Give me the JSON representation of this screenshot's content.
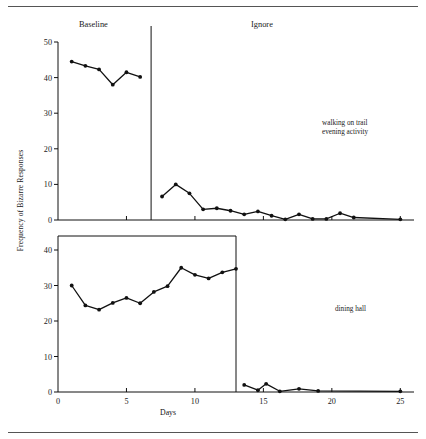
{
  "figure": {
    "ylabel": "Frequency of Bizarre Responses",
    "xlabel": "Days",
    "phase_headers": {
      "baseline": "Baseline",
      "ignore": "Ignore"
    },
    "annotations": {
      "top": "walking on trail\nevening activity",
      "bottom": "dining hall"
    }
  },
  "chart_data": {
    "type": "line",
    "title": "",
    "xlabel": "Days",
    "ylabel": "Frequency of Bizarre Responses",
    "xlim": [
      0,
      26
    ],
    "xticks": [
      0,
      5,
      10,
      15,
      20,
      25
    ],
    "xticklabels": [
      "0",
      "5",
      "10",
      "15",
      "20",
      "25"
    ],
    "grid": false,
    "legend": "none",
    "panels": [
      {
        "name": "walking on trail / evening activity",
        "annotation": "walking on trail\nevening activity",
        "ylim": [
          0,
          50
        ],
        "yticks": [
          0,
          10,
          20,
          30,
          40,
          50
        ],
        "yticklabels": [
          "0",
          "10",
          "20",
          "30",
          "40",
          "50"
        ],
        "phase_change_x": 6.8,
        "series": [
          {
            "name": "Baseline",
            "x": [
              1.0,
              2.0,
              3.0,
              4.0,
              5.0,
              6.0
            ],
            "y": [
              44.5,
              43.3,
              42.3,
              38.0,
              41.5,
              40.2
            ]
          },
          {
            "name": "Ignore",
            "x": [
              7.6,
              8.6,
              9.6,
              10.6,
              11.6,
              12.6,
              13.6,
              14.6,
              15.6,
              16.6,
              17.6,
              18.6,
              19.6,
              20.6,
              21.6,
              25.0
            ],
            "y": [
              6.6,
              10.0,
              7.5,
              3.0,
              3.3,
              2.6,
              1.6,
              2.4,
              1.2,
              0.2,
              1.6,
              0.3,
              0.3,
              1.9,
              0.7,
              0.2
            ]
          }
        ]
      },
      {
        "name": "dining hall",
        "annotation": "dining hall",
        "ylim": [
          0,
          40
        ],
        "yticks": [
          0,
          10,
          20,
          30,
          40
        ],
        "yticklabels": [
          "0",
          "10",
          "20",
          "30",
          "40"
        ],
        "phase_change_x": 13.0,
        "series": [
          {
            "name": "Baseline",
            "x": [
              1.0,
              2.0,
              3.0,
              4.0,
              5.0,
              6.0,
              7.0,
              8.0,
              9.0,
              10.0,
              11.0,
              12.0,
              13.0
            ],
            "y": [
              30.0,
              24.4,
              23.2,
              25.1,
              26.5,
              25.0,
              28.2,
              29.8,
              35.0,
              33.0,
              32.0,
              33.7,
              34.7
            ]
          },
          {
            "name": "Ignore",
            "x": [
              13.6,
              14.6,
              15.2,
              16.2,
              17.6,
              19.0,
              25.0
            ],
            "y": [
              2.0,
              0.5,
              2.3,
              0.2,
              0.9,
              0.3,
              0.2
            ]
          }
        ]
      }
    ]
  }
}
